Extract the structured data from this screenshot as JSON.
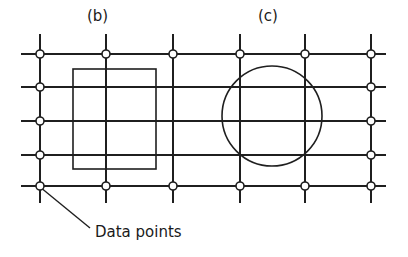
{
  "labels": {
    "panel_b": "(b)",
    "panel_c": "(c)",
    "callout": "Data points"
  },
  "grid": {
    "columns_x": [
      40,
      106,
      173,
      240,
      305,
      371
    ],
    "rows_y": [
      54,
      87,
      121,
      155,
      186
    ],
    "h_line_extent": [
      21,
      386
    ],
    "v_line_extent": [
      34,
      203
    ]
  },
  "data_points": [
    {
      "x": 40,
      "y": 54
    },
    {
      "x": 40,
      "y": 87
    },
    {
      "x": 40,
      "y": 121
    },
    {
      "x": 40,
      "y": 155
    },
    {
      "x": 40,
      "y": 186
    },
    {
      "x": 106,
      "y": 54
    },
    {
      "x": 106,
      "y": 186
    },
    {
      "x": 173,
      "y": 54
    },
    {
      "x": 173,
      "y": 186
    },
    {
      "x": 240,
      "y": 54
    },
    {
      "x": 240,
      "y": 186
    },
    {
      "x": 305,
      "y": 54
    },
    {
      "x": 305,
      "y": 186
    },
    {
      "x": 371,
      "y": 54
    },
    {
      "x": 371,
      "y": 87
    },
    {
      "x": 371,
      "y": 121
    },
    {
      "x": 371,
      "y": 155
    },
    {
      "x": 371,
      "y": 186
    }
  ],
  "shapes": {
    "rectangle": {
      "x": 73,
      "y": 69,
      "width": 83,
      "height": 100,
      "panel": "(b)"
    },
    "circle": {
      "cx": 272,
      "cy": 116,
      "r": 50,
      "panel": "(c)"
    }
  },
  "callout_leader": {
    "x1": 40,
    "y1": 187,
    "x2": 90,
    "y2": 228
  },
  "colors": {
    "ink": "#1f1f1f",
    "background": "#ffffff"
  }
}
